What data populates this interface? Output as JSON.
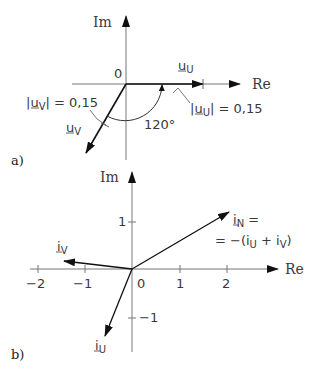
{
  "panels": [
    {
      "id": "a",
      "label": "a)",
      "axes": {
        "x_label": "Re",
        "y_label": "Im",
        "origin_label": "0"
      },
      "phasors": [
        {
          "name": "u_U",
          "symbol": "u",
          "subscript": "U",
          "magnitude_label_prefix": "|",
          "magnitude_label_suffix": "| = 0,15",
          "angle_deg": 0
        },
        {
          "name": "u_V",
          "symbol": "u",
          "subscript": "V",
          "magnitude_label_prefix": "|",
          "magnitude_label_suffix": "| = 0,15",
          "angle_deg": -120
        }
      ],
      "angle_annotation": "120°"
    },
    {
      "id": "b",
      "label": "b)",
      "axes": {
        "x_label": "Re",
        "y_label": "Im",
        "x_ticks": [
          "−2",
          "−1",
          "0",
          "1",
          "2"
        ],
        "y_ticks": [
          "1",
          "−1"
        ]
      },
      "phasors": [
        {
          "name": "i_N",
          "symbol": "i",
          "subscript": "N",
          "equation_line1_suffix": " =",
          "equation_line2": "= −(i",
          "equation_sub_u": "U",
          "equation_plus": " + i",
          "equation_sub_v": "V",
          "equation_close": ")",
          "tip": [
            2.05,
            1.2
          ]
        },
        {
          "name": "i_V",
          "symbol": "i",
          "subscript": "V",
          "tip": [
            -1.45,
            0.2
          ]
        },
        {
          "name": "i_U",
          "symbol": "i",
          "subscript": "U",
          "tip": [
            -0.55,
            -1.4
          ]
        }
      ]
    }
  ]
}
